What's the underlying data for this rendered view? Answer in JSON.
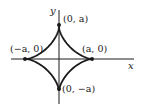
{
  "diagram": {
    "curve": "astroid x^(2/3) + y^(2/3) = a^(2/3)",
    "axes": {
      "x_label": "x",
      "y_label": "y"
    },
    "points": [
      {
        "id": "top",
        "label": "(0, a)"
      },
      {
        "id": "left",
        "label": "(−a, 0)"
      },
      {
        "id": "right",
        "label": "(a, 0)"
      },
      {
        "id": "bottom",
        "label": "(0, −a)"
      }
    ],
    "colors": {
      "stroke": "#1a1a1a",
      "background": "#ffffff"
    }
  }
}
